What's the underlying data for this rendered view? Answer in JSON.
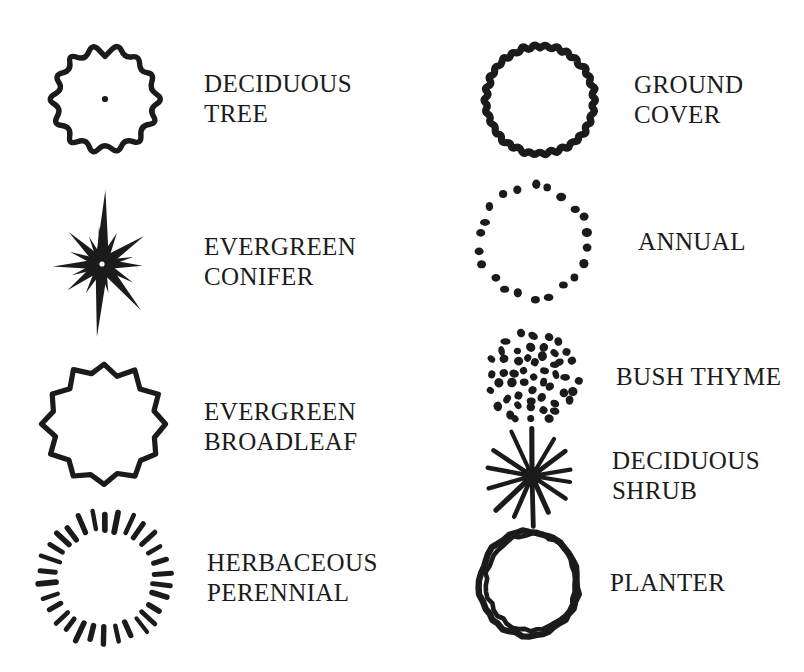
{
  "page": {
    "background_color": "#ffffff",
    "ink_color": "#1b1b1b",
    "width": 804,
    "height": 672
  },
  "legend": {
    "columns": [
      {
        "name": "left-column",
        "entries": [
          {
            "id": "deciduous-tree",
            "symbol": "scalloped-circle-with-center-dot-icon",
            "label": "DECIDUOUS\nTREE",
            "label_lines": [
              "DECIDUOUS",
              "TREE"
            ]
          },
          {
            "id": "evergreen-conifer",
            "symbol": "spiky-star-burst-icon",
            "label": "EVERGREEN\nCONIFER",
            "label_lines": [
              "EVERGREEN",
              "CONIFER"
            ]
          },
          {
            "id": "evergreen-broadleaf",
            "symbol": "pointed-star-polygon-icon",
            "label": "EVERGREEN\nBROADLEAF",
            "label_lines": [
              "EVERGREEN",
              "BROADLEAF"
            ]
          },
          {
            "id": "herbaceous-perennial",
            "symbol": "radial-dash-ring-icon",
            "label": "HERBACEOUS\nPERENNIAL",
            "label_lines": [
              "HERBACEOUS",
              "PERENNIAL"
            ]
          }
        ]
      },
      {
        "name": "right-column",
        "entries": [
          {
            "id": "ground-cover",
            "symbol": "fine-scalloped-thick-circle-icon",
            "label": "GROUND\nCOVER",
            "label_lines": [
              "GROUND",
              "COVER"
            ]
          },
          {
            "id": "annual",
            "symbol": "dotted-ring-icon",
            "label": "ANNUAL",
            "label_lines": [
              "ANNUAL"
            ]
          },
          {
            "id": "bush-thyme",
            "symbol": "dot-filled-circle-icon",
            "label": "BUSH THYME",
            "label_lines": [
              "BUSH THYME"
            ]
          },
          {
            "id": "deciduous-shrub",
            "symbol": "radial-line-burst-icon",
            "label": "DECIDUOUS\nSHRUB",
            "label_lines": [
              "DECIDUOUS",
              "SHRUB"
            ]
          },
          {
            "id": "planter",
            "symbol": "double-circle-icon",
            "label": "PLANTER",
            "label_lines": [
              "PLANTER"
            ]
          }
        ]
      }
    ]
  }
}
